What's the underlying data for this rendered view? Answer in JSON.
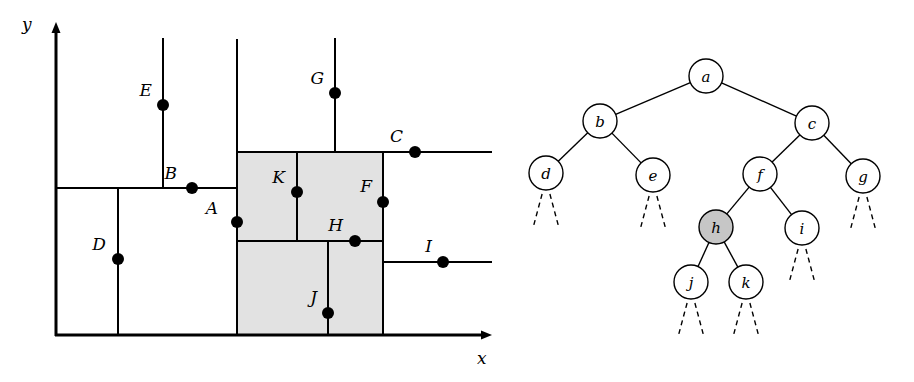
{
  "figure": {
    "kind": "kd-tree-partition-and-tree-diagram",
    "background": "#ffffff",
    "ink": "#000000",
    "shaded_fill": "#e2e2e2",
    "shaded_stroke": "#000000",
    "node_fill": "#ffffff",
    "highlight_fill": "#c6c6c6"
  },
  "plane": {
    "axes": {
      "x_label": "x",
      "y_label": "y",
      "origin": {
        "x": 56,
        "y": 335
      },
      "x_axis_end": {
        "x": 492,
        "y": 335
      },
      "y_axis_end": {
        "x": 56,
        "y": 22
      },
      "x_label_pos": {
        "x": 477,
        "y": 364
      },
      "y_label_pos": {
        "x": 22,
        "y": 30
      }
    },
    "shaded_regions": [
      {
        "name": "region-upper",
        "x": 237,
        "y": 152,
        "w": 146,
        "h": 89
      },
      {
        "name": "region-lower",
        "x": 237,
        "y": 241,
        "w": 146,
        "h": 94
      }
    ],
    "split_lines": [
      {
        "name": "split-A-vertical",
        "x1": 237,
        "y1": 39,
        "x2": 237,
        "y2": 335
      },
      {
        "name": "split-B-horizontal",
        "x1": 56,
        "y1": 188,
        "x2": 237,
        "y2": 188
      },
      {
        "name": "split-C-horizontal",
        "x1": 237,
        "y1": 152,
        "x2": 492,
        "y2": 152
      },
      {
        "name": "split-D-vertical",
        "x1": 118,
        "y1": 188,
        "x2": 118,
        "y2": 335
      },
      {
        "name": "split-E-vertical",
        "x1": 163,
        "y1": 38,
        "x2": 163,
        "y2": 188
      },
      {
        "name": "split-F-vertical",
        "x1": 383,
        "y1": 152,
        "x2": 383,
        "y2": 335
      },
      {
        "name": "split-G-vertical",
        "x1": 335,
        "y1": 38,
        "x2": 335,
        "y2": 152
      },
      {
        "name": "split-H-horizontal",
        "x1": 237,
        "y1": 241,
        "x2": 383,
        "y2": 241
      },
      {
        "name": "split-I-horizontal",
        "x1": 383,
        "y1": 262,
        "x2": 492,
        "y2": 262
      },
      {
        "name": "split-J-vertical",
        "x1": 328,
        "y1": 241,
        "x2": 328,
        "y2": 335
      },
      {
        "name": "split-K-vertical",
        "x1": 297,
        "y1": 152,
        "x2": 297,
        "y2": 241
      }
    ],
    "points": [
      {
        "id": "A",
        "x": 237,
        "y": 222,
        "label_x": 218,
        "label_y": 214,
        "anchor": "end"
      },
      {
        "id": "B",
        "x": 192,
        "y": 188,
        "label_x": 177,
        "label_y": 179,
        "anchor": "end"
      },
      {
        "id": "C",
        "x": 415,
        "y": 152,
        "label_x": 403,
        "label_y": 142,
        "anchor": "end"
      },
      {
        "id": "D",
        "x": 118,
        "y": 259,
        "label_x": 106,
        "label_y": 250,
        "anchor": "end"
      },
      {
        "id": "E",
        "x": 163,
        "y": 105,
        "label_x": 152,
        "label_y": 96,
        "anchor": "end"
      },
      {
        "id": "F",
        "x": 383,
        "y": 202,
        "label_x": 372,
        "label_y": 192,
        "anchor": "end"
      },
      {
        "id": "G",
        "x": 335,
        "y": 93,
        "label_x": 324,
        "label_y": 84,
        "anchor": "end"
      },
      {
        "id": "H",
        "x": 355,
        "y": 241,
        "label_x": 343,
        "label_y": 231,
        "anchor": "end"
      },
      {
        "id": "I",
        "x": 443,
        "y": 262,
        "label_x": 432,
        "label_y": 252,
        "anchor": "end"
      },
      {
        "id": "J",
        "x": 328,
        "y": 313,
        "label_x": 317,
        "label_y": 303,
        "anchor": "end"
      },
      {
        "id": "K",
        "x": 297,
        "y": 192,
        "label_x": 285,
        "label_y": 183,
        "anchor": "end"
      }
    ],
    "point_radius": 6
  },
  "tree": {
    "node_radius": 17,
    "highlighted_node": "h",
    "nodes": [
      {
        "id": "a",
        "label": "a",
        "x": 706,
        "y": 76,
        "highlighted": false,
        "stub": false
      },
      {
        "id": "b",
        "label": "b",
        "x": 600,
        "y": 121,
        "highlighted": false,
        "stub": false
      },
      {
        "id": "c",
        "label": "c",
        "x": 812,
        "y": 123,
        "highlighted": false,
        "stub": false
      },
      {
        "id": "d",
        "label": "d",
        "x": 546,
        "y": 173,
        "highlighted": false,
        "stub": true
      },
      {
        "id": "e",
        "label": "e",
        "x": 653,
        "y": 175,
        "highlighted": false,
        "stub": true
      },
      {
        "id": "f",
        "label": "f",
        "x": 760,
        "y": 174,
        "highlighted": false,
        "stub": false
      },
      {
        "id": "g",
        "label": "g",
        "x": 863,
        "y": 176,
        "highlighted": false,
        "stub": true
      },
      {
        "id": "h",
        "label": "h",
        "x": 716,
        "y": 227,
        "highlighted": true,
        "stub": false
      },
      {
        "id": "i",
        "label": "i",
        "x": 802,
        "y": 228,
        "highlighted": false,
        "stub": true
      },
      {
        "id": "j",
        "label": "j",
        "x": 691,
        "y": 282,
        "highlighted": false,
        "stub": true
      },
      {
        "id": "k",
        "label": "k",
        "x": 746,
        "y": 282,
        "highlighted": false,
        "stub": true
      }
    ],
    "edges": [
      {
        "from": "a",
        "to": "b"
      },
      {
        "from": "a",
        "to": "c"
      },
      {
        "from": "b",
        "to": "d"
      },
      {
        "from": "b",
        "to": "e"
      },
      {
        "from": "c",
        "to": "f"
      },
      {
        "from": "c",
        "to": "g"
      },
      {
        "from": "f",
        "to": "h"
      },
      {
        "from": "f",
        "to": "i"
      },
      {
        "from": "h",
        "to": "j"
      },
      {
        "from": "h",
        "to": "k"
      }
    ],
    "stub_geometry": {
      "length": 38,
      "spread": 13,
      "gap": 4
    }
  }
}
